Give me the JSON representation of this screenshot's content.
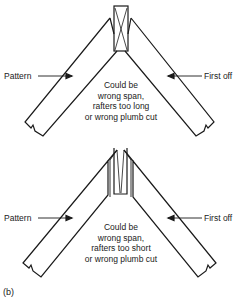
{
  "figure_label": "(b)",
  "diagrams": [
    {
      "id": "top",
      "left_label": "Pattern",
      "right_label": "First off",
      "note_lines": [
        "Could be",
        "wrong span,",
        "rafters too long",
        "or wrong plumb cut"
      ]
    },
    {
      "id": "bottom",
      "left_label": "Pattern",
      "right_label": "First off",
      "note_lines": [
        "Could be",
        "wrong span,",
        "rafters too short",
        "or wrong plumb cut"
      ]
    }
  ],
  "colors": {
    "line": "#1a1a1a",
    "background": "#ffffff"
  }
}
